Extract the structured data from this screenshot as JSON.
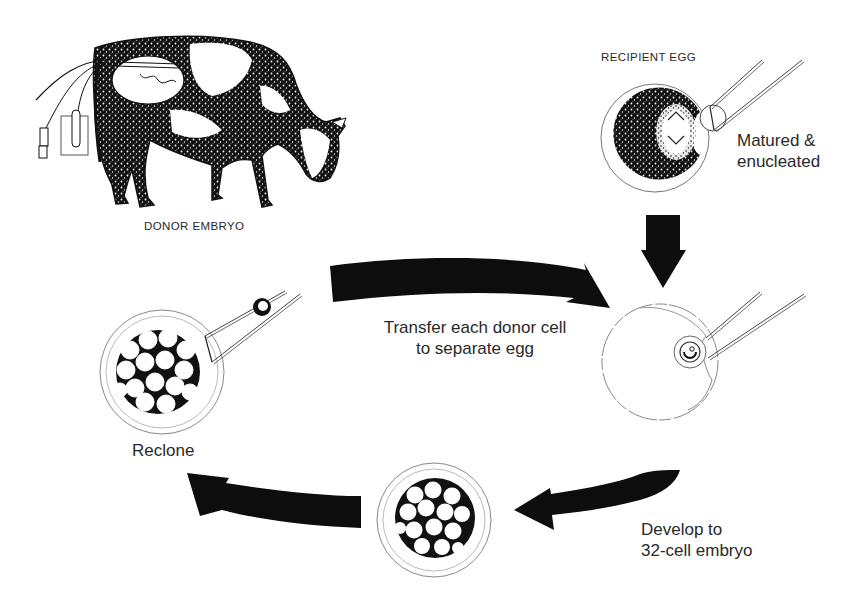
{
  "diagram": {
    "type": "process-cycle",
    "labels": {
      "donor_embryo": "DONOR EMBRYO",
      "recipient_egg": "RECIPIENT EGG",
      "matured_line1": "Matured &",
      "matured_line2": "enucleated",
      "transfer_line1": "Transfer each donor cell",
      "transfer_line2": "to separate egg",
      "develop_line1": "Develop to",
      "develop_line2": "32-cell embryo",
      "reclone": "Reclone"
    },
    "nodes": [
      {
        "id": "donor-cow",
        "label": "DONOR EMBRYO",
        "icon": "cow-with-flushing-apparatus"
      },
      {
        "id": "recipient-egg",
        "label": "RECIPIENT EGG",
        "caption": "Matured & enucleated",
        "icon": "enucleation-pipette"
      },
      {
        "id": "nuclear-transfer",
        "label": "",
        "icon": "egg-with-injected-donor-cell"
      },
      {
        "id": "embryo-32-cell",
        "label": "",
        "caption": "Develop to 32-cell embryo",
        "icon": "multicell-embryo"
      },
      {
        "id": "reclone-embryo",
        "label": "Reclone",
        "icon": "embryo-with-pipette"
      }
    ],
    "edges": [
      {
        "from": "recipient-egg",
        "to": "nuclear-transfer",
        "style": "straight-down-arrow"
      },
      {
        "from": "donor-cow",
        "to": "nuclear-transfer",
        "label": "Transfer each donor cell to separate egg",
        "style": "curved-arrow-right"
      },
      {
        "from": "nuclear-transfer",
        "to": "embryo-32-cell",
        "label": "Develop to 32-cell embryo",
        "style": "curved-arrow-left"
      },
      {
        "from": "embryo-32-cell",
        "to": "reclone-embryo",
        "style": "curved-arrow-left"
      },
      {
        "from": "reclone-embryo",
        "to": "nuclear-transfer",
        "style": "implied-cycle"
      }
    ],
    "colors": {
      "ink": "#111111",
      "text": "#2a2a2a",
      "outline": "#666666",
      "background": "#ffffff"
    }
  }
}
